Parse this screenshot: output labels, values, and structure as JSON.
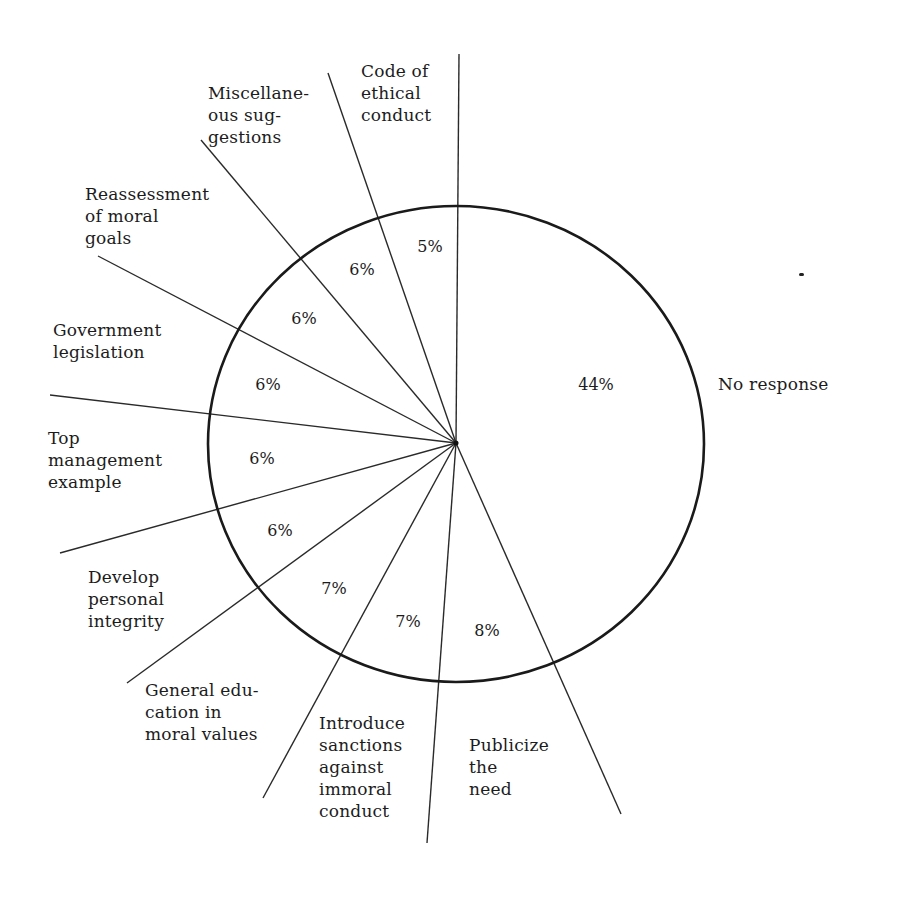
{
  "chart_data": {
    "type": "pie",
    "title": "",
    "categories": [
      "No response",
      "Publicize the need",
      "Introduce sanctions against immoral conduct",
      "General education in moral values",
      "Develop personal integrity",
      "Top management example",
      "Government legislation",
      "Reassessment of moral goals",
      "Miscellaneous suggestions",
      "Code of ethical conduct"
    ],
    "values": [
      44,
      8,
      7,
      7,
      6,
      6,
      6,
      6,
      6,
      5
    ],
    "unit": "%",
    "legend": "none (labels placed outside slices with leader lines)",
    "start_angle": "12 o'clock, clockwise"
  },
  "geometry": {
    "center": [
      456,
      444
    ],
    "rx": 248,
    "ry": 238,
    "spokes": [
      {
        "x": 459,
        "y": 54
      },
      {
        "x": 328,
        "y": 73
      },
      {
        "x": 201,
        "y": 140
      },
      {
        "x": 98,
        "y": 256
      },
      {
        "x": 50,
        "y": 395
      },
      {
        "x": 60,
        "y": 553
      },
      {
        "x": 127,
        "y": 683
      },
      {
        "x": 263,
        "y": 798
      },
      {
        "x": 427,
        "y": 843
      },
      {
        "x": 621,
        "y": 814
      }
    ]
  },
  "labels": {
    "no_response": "No response",
    "publicize": "Publicize\nthe\nneed",
    "introduce": "Introduce\nsanctions\nagainst\nimmoral\nconduct",
    "general_ed": "General edu-\ncation in\nmoral values",
    "develop": "Develop\npersonal\nintegrity",
    "top_mgmt": "Top\nmanagement\nexample",
    "government": "Government\nlegislation",
    "reassessment": "Reassessment\nof moral\ngoals",
    "misc": "Miscellane-\nous sug-\ngestions",
    "code": "Code of\nethical\nconduct"
  },
  "percentages": {
    "no_response": "44%",
    "publicize": "8%",
    "introduce": "7%",
    "general_ed": "7%",
    "develop": "6%",
    "top_mgmt": "6%",
    "government": "6%",
    "reassessment": "6%",
    "misc": "6%",
    "code": "5%"
  }
}
